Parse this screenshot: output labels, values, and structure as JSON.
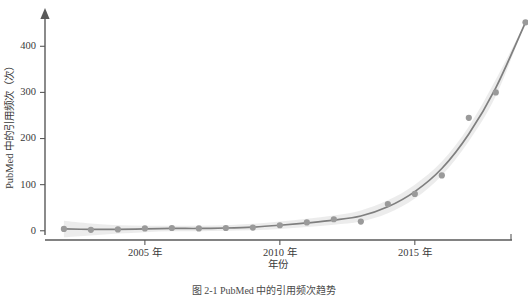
{
  "figure": {
    "caption": "图 2-1 PubMed 中的引用频次趋势"
  },
  "chart_data": {
    "type": "scatter",
    "title": "",
    "xlabel": "年份",
    "ylabel": "PubMed 中的引用频次（次）",
    "xlim": [
      2001.3,
      2018.6
    ],
    "ylim": [
      -20,
      470
    ],
    "grid": false,
    "legend": "none",
    "xticks": [
      2005,
      2010,
      2015
    ],
    "xtick_labels": [
      "2005 年",
      "2010 年",
      "2015 年"
    ],
    "yticks": [
      0,
      100,
      200,
      300,
      400
    ],
    "ytick_labels": [
      "0",
      "100",
      "200",
      "300",
      "400"
    ],
    "x": [
      2002,
      2003,
      2004,
      2005,
      2006,
      2007,
      2008,
      2009,
      2010,
      2011,
      2012,
      2013,
      2014,
      2015,
      2016,
      2017,
      2018
    ],
    "values": [
      4,
      2,
      3,
      5,
      6,
      5,
      6,
      7,
      12,
      18,
      25,
      20,
      58,
      80,
      120,
      245,
      300
    ],
    "series": [
      {
        "name": "引用频次",
        "values": [
          4,
          2,
          3,
          5,
          6,
          5,
          6,
          7,
          12,
          18,
          25,
          20,
          58,
          80,
          120,
          245,
          300
        ]
      }
    ],
    "extra_point": {
      "x": 2019.1,
      "y": 452
    },
    "fit": {
      "type": "loess-exponential",
      "x": [
        2002,
        2003,
        2004,
        2005,
        2006,
        2007,
        2008,
        2009,
        2010,
        2011,
        2012,
        2013,
        2014,
        2015,
        2016,
        2017,
        2018,
        2019.1
      ],
      "y": [
        4,
        3,
        3,
        4,
        5,
        5,
        6,
        8,
        12,
        17,
        23,
        32,
        52,
        85,
        135,
        210,
        310,
        452
      ],
      "band_upper": [
        22,
        16,
        12,
        11,
        11,
        11,
        12,
        15,
        20,
        26,
        33,
        44,
        66,
        100,
        150,
        226,
        328,
        452
      ],
      "band_lower": [
        -14,
        -10,
        -6,
        -3,
        -1,
        -1,
        0,
        1,
        4,
        8,
        13,
        20,
        38,
        70,
        120,
        194,
        292,
        452
      ]
    }
  },
  "axes": {
    "y_arrow": "up-arrow",
    "x_end": "tick"
  }
}
